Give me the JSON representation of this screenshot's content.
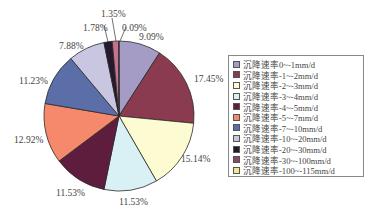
{
  "chart_data": {
    "type": "pie",
    "title": "",
    "legend_position": "right",
    "start_angle": "12 o'clock, clockwise",
    "categories": [
      "沉降速率0~-1mm/d",
      "沉降速率-1~-2mm/d",
      "沉降速率-2~-3mm/d",
      "沉降速率-3~-4mm/d",
      "沉降速率-4~-5mm/d",
      "沉降速率-5~-7mm/d",
      "沉降速率-7~-10mm/d",
      "沉降速率-10~-20mm/d",
      "沉降速率-20~-30mm/d",
      "沉降速率-30~-100mm/d",
      "沉降速率-100~-115mm/d"
    ],
    "values": [
      9.09,
      17.45,
      15.14,
      11.53,
      11.53,
      12.92,
      11.23,
      7.88,
      1.78,
      1.35,
      0.09
    ],
    "value_labels": [
      "9.09%",
      "17.45%",
      "15.14%",
      "11.53%",
      "11.53%",
      "12.92%",
      "11.23%",
      "7.88%",
      "1.78%",
      "1.35%",
      "0.09%"
    ],
    "colors": [
      "#a59cc6",
      "#8a3b4f",
      "#fdfbd1",
      "#d9f1f4",
      "#5e1d3d",
      "#f6896b",
      "#5b6ea7",
      "#c9c6e2",
      "#25192e",
      "#c5728f",
      "#f7f3c6"
    ],
    "unit": "%"
  },
  "legend": {
    "items": [
      {
        "label": "沉降速率0~-1mm/d",
        "color": "#a59cc6"
      },
      {
        "label": "沉降速率-1~-2mm/d",
        "color": "#8a3b4f"
      },
      {
        "label": "沉降速率-2~-3mm/d",
        "color": "#fdfbd1"
      },
      {
        "label": "沉降速率-3~-4mm/d",
        "color": "#d9f1f4"
      },
      {
        "label": "沉降速率-4~-5mm/d",
        "color": "#5e1d3d"
      },
      {
        "label": "沉降速率-5~-7mm/d",
        "color": "#f6896b"
      },
      {
        "label": "沉降速率-7~-10mm/d",
        "color": "#5b6ea7"
      },
      {
        "label": "沉降速率-10~-20mm/d",
        "color": "#c9c6e2"
      },
      {
        "label": "沉降速率-20~-30mm/d",
        "color": "#25192e"
      },
      {
        "label": "沉降速率-30~-100mm/d",
        "color": "#8a4a62"
      },
      {
        "label": "沉降速率-100~-115mm/d",
        "color": "#f3e98a"
      }
    ]
  },
  "pie_labels": [
    {
      "text": "9.09%",
      "x": 139,
      "y": 33
    },
    {
      "text": "17.45%",
      "x": 194,
      "y": 75
    },
    {
      "text": "15.14%",
      "x": 181,
      "y": 155
    },
    {
      "text": "11.53%",
      "x": 119,
      "y": 198
    },
    {
      "text": "11.53%",
      "x": 56,
      "y": 189
    },
    {
      "text": "12.92%",
      "x": 14,
      "y": 136
    },
    {
      "text": "11.23%",
      "x": 19,
      "y": 77
    },
    {
      "text": "7.88%",
      "x": 59,
      "y": 42
    },
    {
      "text": "1.78%",
      "x": 83,
      "y": 24
    },
    {
      "text": "1.35%",
      "x": 101,
      "y": 10
    },
    {
      "text": "0.09%",
      "x": 122,
      "y": 24
    }
  ]
}
